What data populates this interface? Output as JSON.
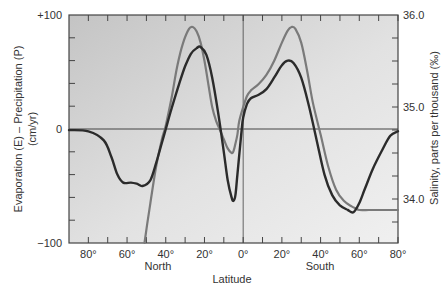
{
  "chart_data": {
    "type": "line",
    "title": "",
    "xlabel": "Latitude",
    "xlabel_north": "North",
    "xlabel_south": "South",
    "ylabel_left": "Evaporation (E) – Precipitation (P)",
    "ylabel_left_units": "(cm/yr)",
    "ylabel_right": "Salinity, parts per thousand (‰)",
    "x_ticks": [
      "80°",
      "60°",
      "40°",
      "20°",
      "0°",
      "20°",
      "40°",
      "60°",
      "80°"
    ],
    "x_tick_values": [
      80,
      60,
      40,
      20,
      0,
      -20,
      -40,
      -60,
      -80
    ],
    "y_left_ticks": [
      "+100",
      "0",
      "−100"
    ],
    "y_left_tick_values": [
      100,
      0,
      -100
    ],
    "ylim_left": [
      -100,
      100
    ],
    "y_right_ticks": [
      "36.0",
      "35.0",
      "34.0"
    ],
    "y_right_tick_values": [
      36.0,
      35.0,
      34.0
    ],
    "ylim_right": [
      33.5,
      36.0
    ],
    "xlim": [
      90,
      -80
    ],
    "grid": false,
    "zero_line": true,
    "equator_line": true,
    "legend": null,
    "series": [
      {
        "name": "Evaporation – Precipitation (cm/yr)",
        "axis": "left",
        "color": "#2b2b2b",
        "x": [
          90,
          80,
          72,
          68,
          65,
          62,
          58,
          55,
          52,
          48,
          45,
          42,
          40,
          37,
          33,
          30,
          27,
          24,
          22,
          19,
          16,
          13,
          10,
          8,
          6,
          5,
          4,
          3,
          1,
          0,
          -2,
          -4,
          -8,
          -12,
          -16,
          -20,
          -23,
          -26,
          -30,
          -34,
          -38,
          -42,
          -46,
          -50,
          -54,
          -57,
          -60,
          -63,
          -67,
          -72,
          -76,
          -80
        ],
        "values": [
          -1,
          -2,
          -10,
          -25,
          -40,
          -47,
          -47,
          -48,
          -50,
          -45,
          -30,
          -12,
          0,
          18,
          40,
          55,
          66,
          71,
          72,
          65,
          45,
          15,
          -20,
          -45,
          -60,
          -63,
          -58,
          -40,
          -5,
          10,
          22,
          27,
          30,
          35,
          45,
          56,
          60,
          58,
          45,
          20,
          -10,
          -40,
          -58,
          -67,
          -71,
          -73,
          -65,
          -52,
          -35,
          -18,
          -6,
          -2
        ]
      },
      {
        "name": "Surface salinity (‰)",
        "axis": "right",
        "color": "#7a7a7a",
        "x": [
          51,
          48,
          45,
          42,
          40,
          37,
          34,
          31,
          28,
          26,
          24,
          22,
          20,
          18,
          16,
          14,
          12,
          10,
          8,
          6,
          5,
          4,
          3,
          2,
          0,
          -2,
          -4,
          -8,
          -12,
          -16,
          -20,
          -23,
          -25,
          -27,
          -30,
          -33,
          -36,
          -40,
          -44,
          -48,
          -52,
          -56,
          -58,
          -60,
          -65,
          -70,
          -75,
          -80
        ],
        "values": [
          33.5,
          33.95,
          34.35,
          34.65,
          34.8,
          35.1,
          35.45,
          35.7,
          35.85,
          35.87,
          35.82,
          35.7,
          35.5,
          35.25,
          35.0,
          34.85,
          34.75,
          34.65,
          34.55,
          34.5,
          34.52,
          34.6,
          34.7,
          34.85,
          35.0,
          35.12,
          35.18,
          35.25,
          35.35,
          35.5,
          35.7,
          35.83,
          35.87,
          35.85,
          35.7,
          35.4,
          35.05,
          34.7,
          34.35,
          34.1,
          33.98,
          33.92,
          33.9,
          33.88,
          33.88,
          33.88,
          33.88,
          33.88
        ]
      }
    ],
    "annotations": []
  },
  "colors": {
    "plot_background_left": "#c9c9c9",
    "plot_background_right": "#ececec",
    "frame": "#444444",
    "ep_line": "#2b2b2b",
    "salinity_line": "#7a7a7a"
  }
}
